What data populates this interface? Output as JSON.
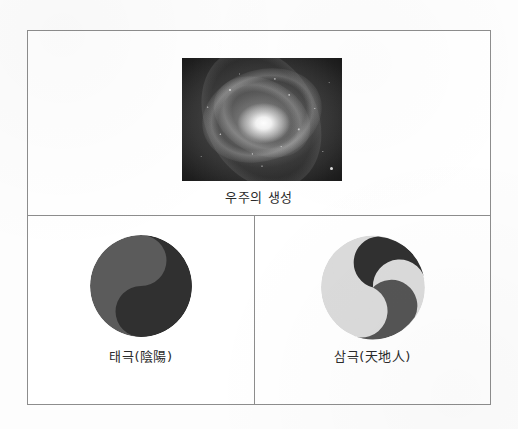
{
  "document": {
    "type": "scanned-figure",
    "page_background": "#fdfdfd",
    "frame_border_color": "#8d8d8d"
  },
  "figure": {
    "cells": {
      "top": {
        "name": "universe-creation-cell",
        "image": {
          "icon": "galaxy-photograph",
          "description": "spiral galaxy grayscale photograph",
          "background": "#0c0c0c",
          "core_color": "#ffffff"
        },
        "caption": "우주의 생성"
      },
      "bottom_left": {
        "name": "taegeuk-cell",
        "symbol": {
          "icon": "taegeuk-yin-yang-symbol",
          "lobes": 2,
          "colors": [
            "#5a5a5a",
            "#2e2e2e"
          ]
        },
        "caption": "태극(陰陽)"
      },
      "bottom_right": {
        "name": "samgeuk-cell",
        "symbol": {
          "icon": "samgeuk-three-part-symbol",
          "lobes": 3,
          "colors": [
            "#2e2e2e",
            "#dedede",
            "#545454"
          ]
        },
        "caption": "삼극(天地人)"
      }
    }
  },
  "colors": {
    "dark_gray": "#2e2e2e",
    "mid_gray": "#5a5a5a",
    "light_gray": "#dedede",
    "border": "#8d8d8d",
    "text": "#2b2b2b"
  }
}
